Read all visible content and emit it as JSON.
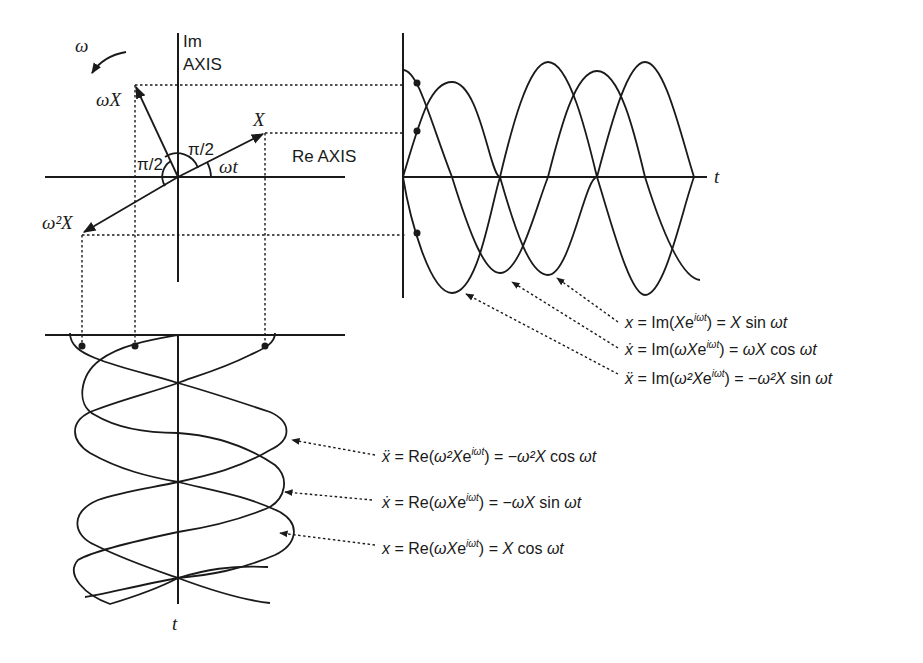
{
  "phasor": {
    "im_axis_label_1": "Im",
    "im_axis_label_2": "AXIS",
    "re_axis_label": "Re AXIS",
    "omega_rotation_label": "ω",
    "vector_x_label": "X",
    "vector_omega_x_label": "ωX",
    "vector_omega2_x_label": "ω²X",
    "angle_upper_label": "π/2",
    "angle_left_label": "π/2",
    "angle_omega_t_label": "ωt"
  },
  "time_plot_right": {
    "axis_label": "t"
  },
  "time_plot_bottom": {
    "axis_label": "t"
  },
  "equations_imag": [
    {
      "lhs": "x",
      "text": "x = Im(Xe^{iωt}) = X sin ωt"
    },
    {
      "lhs": "ẋ",
      "text": "ẋ = Im(ωXe^{iωt}) = ωX cos ωt"
    },
    {
      "lhs": "ẍ",
      "text": "ẍ = Im(ω²Xe^{iωt}) = −ω²X sin ωt"
    }
  ],
  "equations_real": [
    {
      "lhs": "ẍ",
      "text": "ẍ = Re(ω²Xe^{iωt}) = −ω²X cos ωt"
    },
    {
      "lhs": "ẋ",
      "text": "ẋ = Re(ωXe^{iωt}) = −ωX sin ωt"
    },
    {
      "lhs": "x",
      "text": "x = Re(ωXe^{iωt}) = X cos ωt"
    }
  ],
  "eq_parts": {
    "im1": {
      "a": "x",
      "b": " = Im(",
      "c": "X",
      "d": "e",
      "sup": "iωt",
      "e": ") = ",
      "f": "X",
      "g": " sin ",
      "h": "ωt"
    },
    "im2": {
      "a": "ẋ",
      "b": " = Im(",
      "c": "ωX",
      "d": "e",
      "sup": "iωt",
      "e": ") = ",
      "f": "ωX",
      "g": " cos ",
      "h": "ωt"
    },
    "im3": {
      "a": "ẍ",
      "b": " = Im(",
      "c": "ω²X",
      "d": "e",
      "sup": "iωt",
      "e": ") = −",
      "f": "ω²X",
      "g": " sin ",
      "h": "ωt"
    },
    "re1": {
      "a": "ẍ",
      "b": " = Re(",
      "c": "ω²X",
      "d": "e",
      "sup": "iωt",
      "e": ") = −",
      "f": "ω²X",
      "g": " cos ",
      "h": "ωt"
    },
    "re2": {
      "a": "ẋ",
      "b": " = Re(",
      "c": "ωX",
      "d": "e",
      "sup": "iωt",
      "e": ") = −",
      "f": "ωX",
      "g": " sin ",
      "h": "ωt"
    },
    "re3": {
      "a": "x",
      "b": " = Re(",
      "c": "ωX",
      "d": "e",
      "sup": "iωt",
      "e": ") = ",
      "f": "X",
      "g": " cos ",
      "h": "ωt"
    }
  }
}
